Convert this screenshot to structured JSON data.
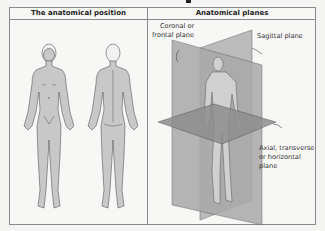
{
  "table": {
    "columns": [
      {
        "title": "The anatomical position"
      },
      {
        "title": "Anatomical planes"
      }
    ]
  },
  "planes": {
    "coronal_line1": "Coronal or",
    "coronal_line2": "frontal plane",
    "sagittal": "Sagittal plane",
    "axial_line1": "Axial, transverse",
    "axial_line2": "or horizontal",
    "axial_line3": "plane"
  },
  "figures": {
    "left": [
      "anterior-view-figure",
      "posterior-view-figure"
    ],
    "right": [
      "figure-with-planes"
    ]
  },
  "colors": {
    "body_fill": "#c8c8c8",
    "outline": "#555555",
    "plane_light": "#b5b5b5",
    "plane_dark": "#8e8e8e",
    "border": "#8a8a8a"
  }
}
